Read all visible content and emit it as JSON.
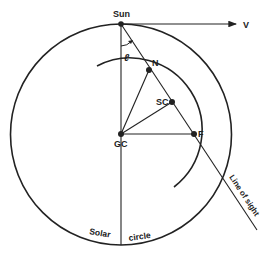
{
  "diagram": {
    "type": "galactic-geometry",
    "colors": {
      "line": "#222222",
      "background": "#ffffff"
    },
    "points": {
      "sun": {
        "label": "Sun",
        "x": 121,
        "y": 24
      },
      "gc": {
        "label": "GC",
        "x": 121,
        "y": 134
      },
      "n": {
        "label": "N",
        "x": 149,
        "y": 70
      },
      "sc": {
        "label": "SC",
        "x": 172,
        "y": 102
      },
      "f": {
        "label": "F",
        "x": 194,
        "y": 134
      }
    },
    "velocity_label": "V",
    "angle_label": "ℓ",
    "line_of_sight_label": "Line of sight",
    "solar_circle_label_left": "Solar",
    "solar_circle_label_right": "circle"
  }
}
